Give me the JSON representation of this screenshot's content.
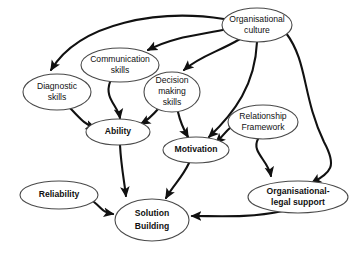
{
  "diagram": {
    "canvas": {
      "width": 356,
      "height": 255,
      "background": "#ffffff"
    },
    "style": {
      "node_fill": "#ffffff",
      "node_stroke": "#4a4a4a",
      "edge_color": "#111111",
      "label_color": "#111111"
    },
    "nodes": [
      {
        "id": "diagnostic-skills",
        "label_line1": "Diagnostic",
        "label_line2": "skills",
        "bold": false,
        "cx": 57,
        "cy": 92,
        "rx": 34,
        "ry": 18
      },
      {
        "id": "communication-skills",
        "label_line1": "Communication",
        "label_line2": "skills",
        "bold": false,
        "cx": 120,
        "cy": 65,
        "rx": 39,
        "ry": 17
      },
      {
        "id": "decision-making-skills",
        "label_line1": "Decision",
        "label_line2": "making",
        "label_line3": "skills",
        "bold": false,
        "cx": 172,
        "cy": 92,
        "rx": 28,
        "ry": 20
      },
      {
        "id": "organisational-culture",
        "label_line1": "Organisational",
        "label_line2": "culture",
        "bold": false,
        "cx": 257,
        "cy": 25,
        "rx": 35,
        "ry": 17
      },
      {
        "id": "relationship-framework",
        "label_line1": "Relationship",
        "label_line2": "Framework",
        "bold": false,
        "cx": 263,
        "cy": 122,
        "rx": 35,
        "ry": 17
      },
      {
        "id": "ability",
        "label_line1": "Ability",
        "bold": true,
        "cx": 118,
        "cy": 132,
        "rx": 32,
        "ry": 13
      },
      {
        "id": "motivation",
        "label_line1": "Motivation",
        "bold": true,
        "cx": 196,
        "cy": 150,
        "rx": 33,
        "ry": 13
      },
      {
        "id": "reliability",
        "label_line1": "Reliability",
        "bold": true,
        "cx": 59,
        "cy": 195,
        "rx": 39,
        "ry": 14
      },
      {
        "id": "organisational-legal-support",
        "label_line1": "Organisational-",
        "label_line2": "legal support",
        "bold": true,
        "cx": 298,
        "cy": 197,
        "rx": 50,
        "ry": 16
      },
      {
        "id": "solution-building",
        "label_line1": "Solution",
        "label_line2": "Building",
        "bold": true,
        "cx": 152,
        "cy": 220,
        "rx": 37,
        "ry": 21
      }
    ],
    "edges": [
      {
        "id": "edge-culture-to-diagnostic",
        "from": "organisational-culture",
        "to": "diagnostic-skills"
      },
      {
        "id": "edge-culture-to-communication",
        "from": "organisational-culture",
        "to": "communication-skills"
      },
      {
        "id": "edge-culture-to-decision",
        "from": "organisational-culture",
        "to": "decision-making-skills"
      },
      {
        "id": "edge-culture-to-motivation",
        "from": "organisational-culture",
        "to": "motivation"
      },
      {
        "id": "edge-culture-to-legal-support",
        "from": "organisational-culture",
        "to": "organisational-legal-support"
      },
      {
        "id": "edge-diagnostic-to-ability",
        "from": "diagnostic-skills",
        "to": "ability"
      },
      {
        "id": "edge-communication-to-ability",
        "from": "communication-skills",
        "to": "ability"
      },
      {
        "id": "edge-decision-to-ability",
        "from": "decision-making-skills",
        "to": "ability"
      },
      {
        "id": "edge-decision-to-motivation",
        "from": "decision-making-skills",
        "to": "motivation"
      },
      {
        "id": "edge-relationship-to-motivation",
        "from": "relationship-framework",
        "to": "motivation"
      },
      {
        "id": "edge-relationship-to-legal-support",
        "from": "relationship-framework",
        "to": "organisational-legal-support"
      },
      {
        "id": "edge-ability-to-solution",
        "from": "ability",
        "to": "solution-building"
      },
      {
        "id": "edge-motivation-to-solution",
        "from": "motivation",
        "to": "solution-building"
      },
      {
        "id": "edge-reliability-to-solution",
        "from": "reliability",
        "to": "solution-building"
      },
      {
        "id": "edge-legal-support-to-solution",
        "from": "organisational-legal-support",
        "to": "solution-building"
      }
    ]
  }
}
